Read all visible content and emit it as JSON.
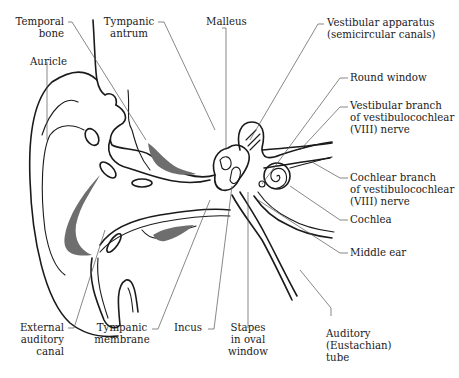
{
  "diagram": {
    "colors": {
      "line": "#1a1a1a",
      "leader": "#555555",
      "shading": "#6e6e6e",
      "background": "#ffffff"
    },
    "labels": {
      "temporal_bone": [
        "Temporal",
        "bone"
      ],
      "tympanic_antrum": [
        "Tympanic",
        "antrum"
      ],
      "malleus": [
        "Malleus"
      ],
      "vestibular_apparatus": [
        "Vestibular apparatus",
        "(semicircular canals)"
      ],
      "auricle": [
        "Auricle"
      ],
      "round_window": [
        "Round window"
      ],
      "vestibular_branch": [
        "Vestibular  branch",
        "of  vestibulocochlear",
        "(VIII) nerve"
      ],
      "cochlear_branch": [
        "Cochlear branch",
        "of  vestibulocochlear",
        "(VIII) nerve"
      ],
      "cochlea": [
        "Cochlea"
      ],
      "middle_ear": [
        "Middle ear"
      ],
      "external_auditory_canal": [
        "External",
        "auditory",
        "canal"
      ],
      "tympanic_membrane": [
        "Tympanic",
        "membrane"
      ],
      "incus": [
        "Incus"
      ],
      "stapes": [
        "Stapes",
        "in oval",
        "window"
      ],
      "auditory_tube": [
        "Auditory",
        "(Eustachian)",
        "tube"
      ]
    }
  }
}
